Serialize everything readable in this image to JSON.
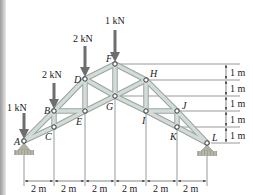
{
  "diagram": {
    "type": "truss",
    "colors": {
      "member": "#c9d3cf",
      "member_edge": "#9aa59f",
      "arrow": "#6e6e6e",
      "support": "#9a9a90",
      "dimension": "#333333"
    },
    "nodes": [
      {
        "id": "A",
        "label": "A",
        "x": 24,
        "y": 141
      },
      {
        "id": "B",
        "label": "B",
        "x": 54,
        "y": 111
      },
      {
        "id": "C",
        "label": "C",
        "x": 54,
        "y": 127
      },
      {
        "id": "D",
        "label": "D",
        "x": 85,
        "y": 79
      },
      {
        "id": "E",
        "label": "E",
        "x": 85,
        "y": 111
      },
      {
        "id": "F",
        "label": "F",
        "x": 115,
        "y": 64
      },
      {
        "id": "G",
        "label": "G",
        "x": 115,
        "y": 96
      },
      {
        "id": "H",
        "label": "H",
        "x": 146,
        "y": 80
      },
      {
        "id": "I",
        "label": "I",
        "x": 146,
        "y": 111
      },
      {
        "id": "J",
        "label": "J",
        "x": 177,
        "y": 111
      },
      {
        "id": "K",
        "label": "K",
        "x": 177,
        "y": 127
      },
      {
        "id": "L",
        "label": "L",
        "x": 207,
        "y": 143
      }
    ],
    "loads": [
      {
        "node": "A",
        "label": "1 kN"
      },
      {
        "node": "B",
        "label": "2 kN"
      },
      {
        "node": "D",
        "label": "2 kN"
      },
      {
        "node": "F",
        "label": "1 kN"
      }
    ],
    "horizontal_dimensions": [
      "2 m",
      "2 m",
      "2 m",
      "2 m",
      "2 m",
      "2 m"
    ],
    "vertical_dimensions": [
      "1 m",
      "1 m",
      "1 m",
      "1 m",
      "1 m"
    ]
  }
}
